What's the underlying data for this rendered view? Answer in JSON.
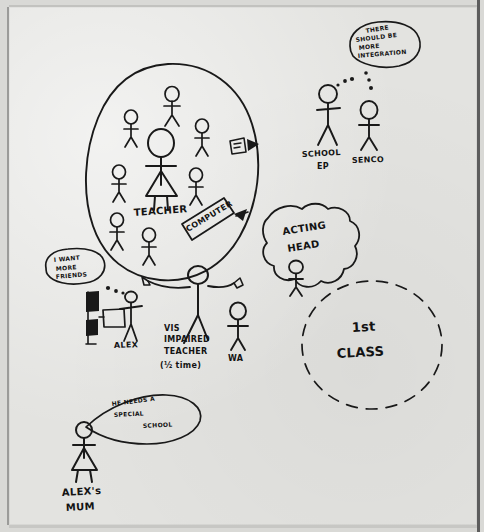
{
  "document": {
    "kind": "hand-drawn-diagram",
    "title": "Alex's school support map",
    "media": "pen on paper, photographed",
    "ink_color": "#191919",
    "paper_color": "#e3e3e0"
  },
  "groups": {
    "classroom": {
      "label": "classroom-oval",
      "teacher_label": "TEACHER",
      "computer_label": "COMPUTER",
      "student_count": 7,
      "shape": "solid-oval"
    },
    "acting_head": {
      "label_line1": "ACTING",
      "label_line2": "HEAD",
      "shape": "cloud"
    },
    "first_class": {
      "label_line1": "1st",
      "label_line2": "CLASS",
      "shape": "dashed-circle"
    }
  },
  "figures": {
    "school_ep": {
      "label_line1": "SCHOOL",
      "label_line2": "EP"
    },
    "senco": {
      "label": "SENCO"
    },
    "alex": {
      "label": "ALEX"
    },
    "vi_teacher": {
      "label_line1": "VIS",
      "label_line2": "IMPAIRED",
      "label_line3": "TEACHER",
      "label_line4": "(½ time)"
    },
    "wa": {
      "label": "WA"
    },
    "alexs_mum": {
      "label_line1": "ALEX's",
      "label_line2": "MUM"
    },
    "acting_head_person": {
      "label": "acting-head-stick-figure"
    },
    "teacher_person": {
      "label": "teacher-stick-figure"
    }
  },
  "speech_bubbles": {
    "integration": {
      "line1": "THERE",
      "line2": "SHOULD BE",
      "line3": "MORE",
      "line4": "INTEGRATION",
      "speaker": "SENCO"
    },
    "friends": {
      "line1": "I WANT",
      "line2": "MORE",
      "line3": "FRIENDS",
      "speaker": "ALEX"
    },
    "special_school": {
      "line1": "HE NEEDS A",
      "line2": "SPECIAL",
      "line3": "SCHOOL",
      "speaker": "ALEX's MUM"
    }
  },
  "objects": {
    "whiteboard": {
      "label": "whiteboard-with-arrow"
    },
    "blackboard": {
      "label": "dark-board-near-alex"
    }
  }
}
